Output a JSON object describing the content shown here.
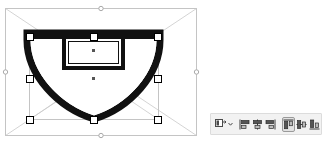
{
  "app": {
    "view": "vector-editor-canvas",
    "background_color": "#ffffff"
  },
  "canvas": {
    "name": "drawing-canvas",
    "width": 210,
    "height": 144,
    "selection": {
      "label": "selected-shape",
      "shape_name": "shield-badge-path",
      "stroke_color": "#000000",
      "fill_color": "#ffffff",
      "outer_bbox": {
        "x": 5,
        "y": 8,
        "width": 192,
        "height": 128
      },
      "inner_bbox": {
        "x": 29,
        "y": 32,
        "width": 129,
        "height": 87
      },
      "guide_color": "#bdbdbd",
      "handle_fill": "#ffffff",
      "handle_stroke": "#000000",
      "circle_handle_fill": "#ffffff",
      "circle_handle_stroke": "#aaaaaa",
      "handle_count": 8,
      "center_marker_count": 2
    }
  },
  "toolbar": {
    "name": "align-and-distribute-toolbar",
    "background_color": "#f2f2f2",
    "border_color": "#dcdcdc",
    "items": [
      {
        "id": "relative-to",
        "label": "Relative To",
        "icon": "relative-to-dropdown-icon",
        "type": "dropdown",
        "active": false
      },
      {
        "id": "align-left",
        "label": "Align Left Edges",
        "icon": "align-left-icon",
        "type": "button",
        "active": false
      },
      {
        "id": "align-center-horizontal",
        "label": "Center On Vertical Axis",
        "icon": "align-center-horizontal-icon",
        "type": "button",
        "active": false
      },
      {
        "id": "align-right",
        "label": "Align Right Edges",
        "icon": "align-right-icon",
        "type": "button",
        "active": false
      },
      {
        "id": "align-top",
        "label": "Align Top Edges",
        "icon": "align-top-icon",
        "type": "button",
        "active": true
      },
      {
        "id": "align-center-vertical",
        "label": "Center On Horizontal Axis",
        "icon": "align-center-vertical-icon",
        "type": "button",
        "active": false
      },
      {
        "id": "align-bottom",
        "label": "Align Bottom Edges",
        "icon": "align-bottom-icon",
        "type": "button",
        "active": false
      },
      {
        "id": "distribute",
        "label": "Distribute",
        "icon": "distribute-grid-icon",
        "type": "button",
        "active": false
      }
    ]
  }
}
